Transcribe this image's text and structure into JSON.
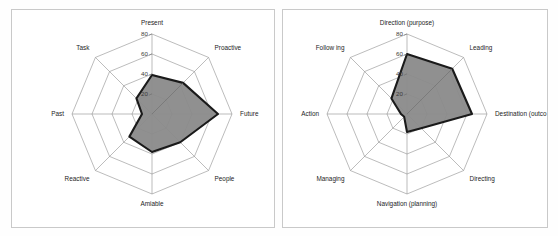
{
  "page": {
    "background_color": "#fefefe",
    "panel_border_color": "#c9c9c9",
    "fill_color": "#8a8a8a",
    "outline_color": "#1a1a1a",
    "grid_color": "#8f8f8f"
  },
  "charts": [
    {
      "id": "left-radar",
      "chart_data": {
        "type": "radar",
        "title": "",
        "categories": [
          "Present",
          "Proactive",
          "Future",
          "People",
          "Amiable",
          "Reactive",
          "Past",
          "Task"
        ],
        "values": [
          39,
          44,
          66,
          40,
          38,
          32,
          10,
          22
        ],
        "ticks": [
          20,
          40,
          60,
          80
        ],
        "tick_labels": [
          "20",
          "40",
          "60",
          "80"
        ],
        "rmax": 80,
        "rmin": 0,
        "grid": true,
        "legend": "none"
      },
      "geometry": {
        "cx": 152,
        "cy": 114,
        "radius": 80,
        "start_angle_deg": -90
      }
    },
    {
      "id": "right-radar",
      "chart_data": {
        "type": "radar",
        "title": "",
        "categories": [
          "Direction (purpose)",
          "Leading",
          "Destination (outco",
          "Directing",
          "Navigation (planning)",
          "Managing",
          "Action",
          "Follow ing"
        ],
        "values": [
          60,
          64,
          65,
          20,
          18,
          4,
          6,
          22
        ],
        "ticks": [
          20,
          40,
          60,
          80
        ],
        "tick_labels": [
          "20",
          "40",
          "60",
          "80"
        ],
        "rmax": 80,
        "rmin": 0,
        "grid": true,
        "legend": "none"
      },
      "geometry": {
        "cx": 128,
        "cy": 114,
        "radius": 80,
        "start_angle_deg": -90
      }
    }
  ]
}
